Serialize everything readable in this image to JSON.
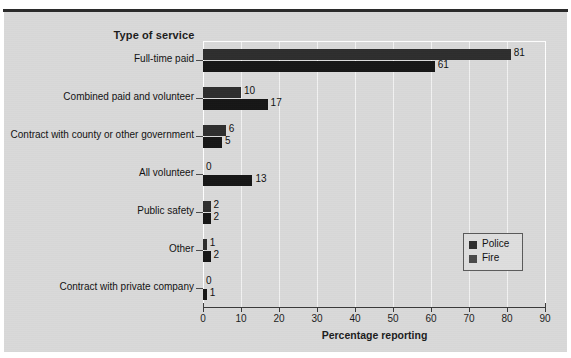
{
  "figure": {
    "clipped_header_ghost": "",
    "clipped_header_ghost2": ""
  },
  "chart_data": {
    "type": "bar",
    "orientation": "horizontal",
    "title": "Type of service",
    "xlabel": "Percentage reporting",
    "ylabel": "",
    "xlim": [
      0,
      90
    ],
    "xticks": [
      0,
      10,
      20,
      30,
      40,
      50,
      60,
      70,
      80,
      90
    ],
    "grid": true,
    "grid_axis": "x",
    "legend_position": "center right",
    "categories": [
      "Full-time paid",
      "Combined paid and volunteer",
      "Contract with county or other government",
      "All volunteer",
      "Public safety",
      "Other",
      "Contract with private company"
    ],
    "series": [
      {
        "name": "Police",
        "color": "#2e2e2e",
        "values": [
          81,
          10,
          6,
          0,
          2,
          1,
          0
        ]
      },
      {
        "name": "Fire",
        "color": "#161616",
        "values": [
          61,
          17,
          5,
          13,
          2,
          2,
          1
        ]
      }
    ]
  },
  "colors": {
    "panel_background": "#d9d9d9",
    "page_background": "#ffffff",
    "gridline": "#f2f2f2",
    "axis": "#3a3a3a",
    "text": "#1c1c1c",
    "police": "#2e2e2e",
    "fire": "#161616"
  }
}
